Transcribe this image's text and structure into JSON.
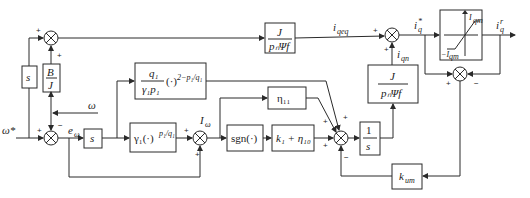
{
  "diagram": {
    "signals": {
      "omega_ref": "ω*",
      "omega": "ω",
      "e_omega": "e",
      "e_omega_sub": "ω",
      "I_omega": "I",
      "I_omega_sub": "ω",
      "i_qeq": "i",
      "i_qeq_sub": "qeq",
      "i_qn": "i",
      "i_qn_sub": "qn",
      "i_q_star": "i",
      "i_q_star_sup": "*",
      "i_q_star_sub": "q",
      "i_q_r": "i",
      "i_q_r_sup": "r",
      "i_q_r_sub": "q"
    },
    "blocks": {
      "s_left": "s",
      "B_over_J_num": "B",
      "B_over_J_den": "J",
      "s_mid": "s",
      "gamma_block": "γ₁(·)",
      "gamma_exp": "p₁/q₁",
      "q_block_num": "q₁",
      "q_block_den": "γ₁p₁",
      "q_block_tail": "(·)",
      "q_block_exp": "2−p₁/q₁",
      "eta11": "η₁₁",
      "sgn": "sgn(·)",
      "k1_eta10": "k₁ + η₁₀",
      "integrator_num": "1",
      "integrator_den": "s",
      "J_top_num": "J",
      "J_top_den": "pₙΨf",
      "J_right_num": "J",
      "J_right_den": "pₙΨf",
      "k_um": "k",
      "k_um_sub": "um",
      "sat_upper": "I",
      "sat_upper_sub": "qm",
      "sat_lower": "−I",
      "sat_lower_sub": "qm"
    },
    "signs": {
      "plus": "+",
      "minus": "−"
    }
  }
}
